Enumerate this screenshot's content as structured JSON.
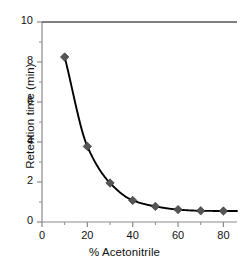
{
  "chart_data": {
    "type": "line",
    "title": "",
    "xlabel": "% Acetonitrile",
    "ylabel": "Retention time (min)",
    "x": [
      10,
      20,
      30,
      40,
      50,
      60,
      70,
      80
    ],
    "values": [
      8.25,
      3.78,
      1.95,
      1.08,
      0.78,
      0.62,
      0.56,
      0.55
    ],
    "series": [
      {
        "name": "Retention time",
        "x": [
          10,
          20,
          30,
          40,
          50,
          60,
          70,
          80
        ],
        "values": [
          8.25,
          3.78,
          1.95,
          1.08,
          0.78,
          0.62,
          0.56,
          0.55
        ]
      }
    ],
    "xlim": [
      0,
      86
    ],
    "ylim": [
      0,
      10
    ],
    "xticks": [
      0,
      20,
      40,
      60,
      80
    ],
    "yticks": [
      0,
      2,
      4,
      6,
      8,
      10
    ],
    "xtick_labels": [
      "0",
      "20",
      "40",
      "60",
      "80"
    ],
    "ytick_labels": [
      "0",
      "2",
      "4",
      "6",
      "8",
      "10"
    ],
    "x_minor_interval": 10,
    "y_minor_interval": 1,
    "grid": false,
    "legend": null,
    "marker": "diamond",
    "marker_color": "#555555",
    "line_color": "#000000",
    "axis_color": "#8a8a8a",
    "frame_top": true,
    "frame_left": true,
    "frame_bottom": true,
    "frame_right": false
  },
  "axes": {
    "y_title": "Retention time (min)",
    "x_title": "% Acetonitrile"
  }
}
